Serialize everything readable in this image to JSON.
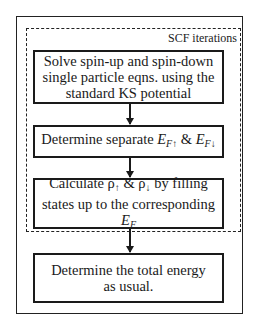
{
  "diagram": {
    "loop_label": "SCF iterations",
    "boxes": [
      {
        "id": "solve",
        "lines": [
          "Solve spin-up and spin-down",
          "single particle eqns. using the",
          "standard KS potential"
        ]
      },
      {
        "id": "fermi",
        "prefix": "Determine separate ",
        "sym1": "E",
        "sub1": "F",
        "arrow1": "↑",
        "amp": " & ",
        "sym2": "E",
        "sub2": "F",
        "arrow2": "↓"
      },
      {
        "id": "density",
        "line1_prefix": "Calculate ",
        "rho": "ρ",
        "up": "↑",
        "amp": " & ",
        "down": "↓",
        "line1_suffix": " by filling",
        "line2_prefix": "states up to the corresponding ",
        "sym": "E",
        "sub": "F"
      },
      {
        "id": "energy",
        "lines": [
          "Determine the total energy",
          "as usual."
        ]
      }
    ],
    "arrows": [
      {
        "from": "solve",
        "to": "fermi"
      },
      {
        "from": "fermi",
        "to": "density"
      },
      {
        "from": "density",
        "to": "energy"
      }
    ]
  }
}
